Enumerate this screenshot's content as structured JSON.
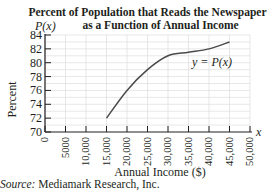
{
  "chart_data": {
    "type": "line",
    "title_lines": [
      "Percent of Population that Reads the Newspaper",
      "as a Function of Annual Income"
    ],
    "xlabel": "Annual Income ($)",
    "ylabel": "Percent",
    "y_axis_var": "P(x)",
    "x_axis_var": "x",
    "curve_label": "y = P(x)",
    "xlim": [
      0,
      50000
    ],
    "ylim": [
      70,
      84
    ],
    "x_ticks": [
      "0",
      "5000",
      "10,000",
      "15,000",
      "20,000",
      "25,000",
      "30,000",
      "35,000",
      "40,000",
      "45,000",
      "50,000"
    ],
    "y_ticks": [
      "70",
      "72",
      "74",
      "76",
      "78",
      "80",
      "82",
      "84"
    ],
    "grid": true,
    "series": [
      {
        "name": "y = P(x)",
        "x": [
          15000,
          20000,
          25000,
          30000,
          35000,
          40000,
          45000
        ],
        "values": [
          72,
          76,
          79,
          81,
          81.5,
          82,
          83
        ]
      }
    ],
    "source": "Mediamark Research, Inc."
  },
  "source_label": "Source:",
  "source_text": " Mediamark Research, Inc."
}
